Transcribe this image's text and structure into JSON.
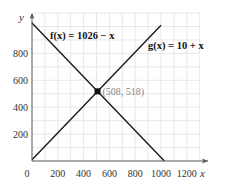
{
  "chart_data": {
    "type": "line",
    "title": "",
    "xlabel": "x",
    "ylabel": "y",
    "xlim": [
      0,
      1300
    ],
    "ylim": [
      0,
      1100
    ],
    "grid": true,
    "grid_step": 100,
    "x_ticks": [
      0,
      200,
      400,
      600,
      800,
      1000,
      1200
    ],
    "y_ticks": [
      200,
      400,
      600,
      800
    ],
    "series": [
      {
        "name": "f(x) = 1026 − x",
        "label": "f(x) = 1026 − x",
        "points": [
          [
            0,
            1026
          ],
          [
            1026,
            0
          ]
        ],
        "color": "#1a1a1a"
      },
      {
        "name": "g(x) = 10 + x",
        "label": "g(x) = 10 + x",
        "points": [
          [
            0,
            10
          ],
          [
            1000,
            1010
          ]
        ],
        "color": "#1a1a1a"
      }
    ],
    "annotations": [
      {
        "type": "point",
        "x": 508,
        "y": 518,
        "label": "(508, 518)"
      }
    ],
    "legend": "inline labels"
  },
  "labels": {
    "x_axis": "x",
    "y_axis": "y",
    "f_label": "f(x) = 1026 − x",
    "g_label": "g(x) = 10 + x",
    "intersection": "(508, 518)"
  }
}
